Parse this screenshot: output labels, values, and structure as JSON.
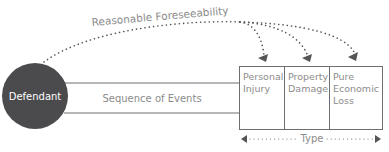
{
  "diagram": {
    "defendant": {
      "label": "Defendant",
      "fill": "#4b4b4d",
      "text_color": "#ffffff"
    },
    "sequence": {
      "label": "Sequence of Events"
    },
    "foreseeability": {
      "label": "Reasonable Foreseeability"
    },
    "types": [
      {
        "line1": "Personal",
        "line2": "Injury",
        "line3": ""
      },
      {
        "line1": "Property",
        "line2": "Damage",
        "line3": ""
      },
      {
        "line1": "Pure",
        "line2": "Economic",
        "line3": "Loss"
      }
    ],
    "type_axis": {
      "label": "Type"
    },
    "colors": {
      "line": "#6e6e6e",
      "text": "#8c8c8c",
      "dots": "#555555"
    }
  }
}
